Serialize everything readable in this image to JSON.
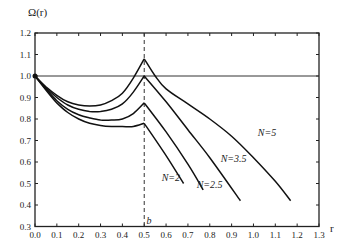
{
  "chart_data": {
    "type": "line",
    "title": "",
    "xlabel": "r",
    "ylabel": "Ω(r)",
    "xlim": [
      0.0,
      1.3
    ],
    "ylim": [
      0.3,
      1.2
    ],
    "grid": false,
    "legend_position": "inline-labels",
    "x_ticks": [
      "0.0",
      "0.1",
      "0.2",
      "0.3",
      "0.4",
      "0.5",
      "0.6",
      "0.7",
      "0.8",
      "0.9",
      "1.0",
      "1.1",
      "1.2",
      "1.3"
    ],
    "y_ticks": [
      "0.3",
      "0.4",
      "0.5",
      "0.6",
      "0.7",
      "0.8",
      "0.9",
      "1.0",
      "1.1",
      "1.2"
    ],
    "reference_lines": [
      {
        "type": "horizontal",
        "y": 1.0,
        "style": "solid"
      },
      {
        "type": "vertical",
        "x": 0.5,
        "style": "dashed",
        "label": "b"
      }
    ],
    "series": [
      {
        "name": "N=5",
        "x": [
          0.0,
          0.05,
          0.1,
          0.15,
          0.2,
          0.25,
          0.3,
          0.35,
          0.4,
          0.45,
          0.5,
          0.55,
          0.6,
          0.7,
          0.8,
          0.9,
          1.0,
          1.1,
          1.17
        ],
        "y": [
          1.0,
          0.95,
          0.91,
          0.88,
          0.865,
          0.86,
          0.865,
          0.885,
          0.92,
          0.99,
          1.08,
          1.0,
          0.94,
          0.87,
          0.8,
          0.72,
          0.62,
          0.51,
          0.42
        ]
      },
      {
        "name": "N=3.5",
        "x": [
          0.0,
          0.05,
          0.1,
          0.15,
          0.2,
          0.25,
          0.3,
          0.35,
          0.4,
          0.45,
          0.5,
          0.6,
          0.7,
          0.8,
          0.94
        ],
        "y": [
          1.0,
          0.945,
          0.9,
          0.865,
          0.845,
          0.835,
          0.835,
          0.845,
          0.87,
          0.925,
          1.0,
          0.88,
          0.75,
          0.62,
          0.42
        ]
      },
      {
        "name": "N=2.5",
        "x": [
          0.0,
          0.05,
          0.1,
          0.15,
          0.2,
          0.25,
          0.3,
          0.35,
          0.4,
          0.45,
          0.5,
          0.6,
          0.7,
          0.77
        ],
        "y": [
          1.0,
          0.94,
          0.885,
          0.845,
          0.82,
          0.805,
          0.795,
          0.795,
          0.8,
          0.825,
          0.875,
          0.74,
          0.59,
          0.47
        ]
      },
      {
        "name": "N=2",
        "x": [
          0.0,
          0.05,
          0.1,
          0.15,
          0.2,
          0.25,
          0.3,
          0.35,
          0.4,
          0.45,
          0.5,
          0.6,
          0.68
        ],
        "y": [
          1.0,
          0.935,
          0.875,
          0.83,
          0.8,
          0.78,
          0.77,
          0.765,
          0.765,
          0.765,
          0.78,
          0.63,
          0.5
        ]
      }
    ],
    "annotations": [
      {
        "text": "N=5",
        "x": 1.02,
        "y": 0.72
      },
      {
        "text": "N=3.5",
        "x": 0.85,
        "y": 0.6
      },
      {
        "text": "N=2.5",
        "x": 0.74,
        "y": 0.48
      },
      {
        "text": "N=2",
        "x": 0.58,
        "y": 0.51
      },
      {
        "text": "b",
        "x": 0.51,
        "y": 0.31
      }
    ]
  }
}
